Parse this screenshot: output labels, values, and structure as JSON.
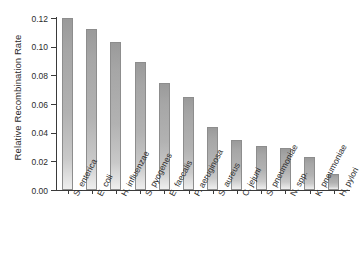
{
  "chart_data": {
    "type": "bar",
    "title": "",
    "subtitle": "",
    "xlabel": "",
    "ylabel": "Relative Recombination Rate",
    "ylim": [
      0.0,
      0.12
    ],
    "yticks": [
      "0.00",
      "0.02",
      "0.04",
      "0.06",
      "0.08",
      "0.10",
      "0.12"
    ],
    "ytick_values": [
      0.0,
      0.02,
      0.04,
      0.06,
      0.08,
      0.1,
      0.12
    ],
    "grid": false,
    "legend": null,
    "categories": [
      "S. enterica",
      "E. coli",
      "H. influenzae",
      "S. pyogenes",
      "E. faecalis",
      "P. aeruginosa",
      "S. aureus",
      "C. jejuni",
      "S. pneumoniae",
      "N. spp.",
      "K. pneumoniae",
      "H. pylori"
    ],
    "values": [
      0.12,
      0.112,
      0.103,
      0.089,
      0.075,
      0.065,
      0.044,
      0.035,
      0.031,
      0.029,
      0.023,
      0.011
    ],
    "bar_color": "#b2b2b2",
    "bar_edge_color": "#8d8d8d",
    "axis_color": "#3a3a3a",
    "background_color": "#ffffff"
  }
}
